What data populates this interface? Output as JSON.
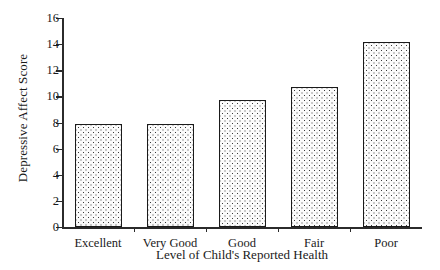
{
  "chart_data": {
    "type": "bar",
    "title": "",
    "xlabel": "Level of Child's Reported Health",
    "ylabel": "Depressive Affect Score",
    "categories": [
      "Excellent",
      "Very Good",
      "Good",
      "Fair",
      "Poor"
    ],
    "values": [
      7.85,
      7.85,
      9.75,
      10.7,
      14.2
    ],
    "ylim": [
      0,
      16
    ],
    "ytick_labels": [
      "0",
      "2",
      "4",
      "6",
      "8",
      "10",
      "12",
      "14",
      "16"
    ],
    "ytick_values": [
      0,
      2,
      4,
      6,
      8,
      10,
      12,
      14,
      16
    ],
    "grid": false,
    "legend": false,
    "bar_fill": "dotted-stipple",
    "bar_edge_color": "#1a1a1a",
    "axis_color": "#2b2b2b"
  }
}
